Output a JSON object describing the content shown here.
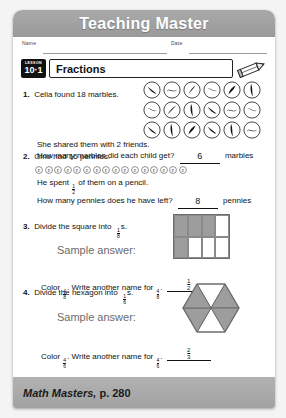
{
  "banner": {
    "title": "Teaching Master"
  },
  "form": {
    "name_label": "Name",
    "date_label": "Date"
  },
  "lesson": {
    "badge_top": "LESSON",
    "badge_number": "10·1",
    "title": "Fractions",
    "pencil_icon": "pencil-icon"
  },
  "problems": [
    {
      "number": "1.",
      "prompt": "Celia found 18 marbles.",
      "line2": "She shared them with 2 friends.",
      "line3": "How many marbles did each child get?",
      "answer": "6",
      "unit": "marbles",
      "marble_count": 18,
      "marble_rows": 3,
      "marble_cols": 6
    },
    {
      "number": "2.",
      "prompt": "Gino had 16 pennies.",
      "line2_pre": "He spent",
      "line2_frac_num": "1",
      "line2_frac_den": "2",
      "line2_post": "of them on a pencil.",
      "line3": "How many pennies does he have left?",
      "answer": "8",
      "unit": "pennies",
      "penny_count": 16,
      "penny_glyph": "P"
    },
    {
      "number": "3.",
      "prompt_pre": "Divide the square into",
      "prompt_frac_num": "1",
      "prompt_frac_den": "8",
      "prompt_post": "s.",
      "sample_label": "Sample answer:",
      "shape": "square",
      "grid_rows": 2,
      "grid_cols": 4,
      "shaded_cells": [
        true,
        true,
        true,
        false,
        true,
        false,
        false,
        false
      ],
      "color_pre": "Color",
      "color_frac_num": "4",
      "color_frac_den": "8",
      "color_mid": ". Write another name for",
      "color_frac2_num": "4",
      "color_frac2_den": "8",
      "color_post": ".",
      "answer_num": "1",
      "answer_den": "2"
    },
    {
      "number": "4.",
      "prompt_pre": "Divide the hexagon into",
      "prompt_frac_num": "1",
      "prompt_frac_den": "6",
      "prompt_post": "s.",
      "sample_label": "Sample answer:",
      "shape": "hexagon",
      "wedges": 6,
      "shaded_wedges": [
        false,
        true,
        true,
        false,
        true,
        true
      ],
      "color_pre": "Color",
      "color_frac_num": "4",
      "color_frac_den": "6",
      "color_mid": ". Write another name for",
      "color_frac2_num": "4",
      "color_frac2_den": "6",
      "color_post": ".",
      "answer_num": "2",
      "answer_den": "3"
    }
  ],
  "footer": {
    "source": "Math Masters,",
    "page": "p. 280"
  },
  "colors": {
    "banner_gray": "#a2a2a2",
    "shade_gray": "#9d9d9d",
    "ink": "#111111",
    "sample_gray": "#6b6b6b"
  }
}
